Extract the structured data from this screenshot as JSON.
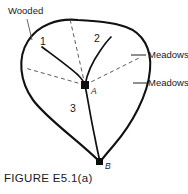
{
  "figure": {
    "caption": "FIGURE E5.1(a)",
    "regions": [
      {
        "id": "region-1",
        "label": "1",
        "x": 40,
        "y": 45
      },
      {
        "id": "region-2",
        "label": "2",
        "x": 94,
        "y": 42
      },
      {
        "id": "region-3",
        "label": "3",
        "x": 70,
        "y": 112
      }
    ],
    "nodes": [
      {
        "id": "node-a",
        "label": "A",
        "x": 85,
        "y": 85,
        "label_x": 91,
        "label_y": 94
      },
      {
        "id": "node-b",
        "label": "B",
        "x": 100,
        "y": 162,
        "label_x": 105,
        "label_y": 169
      }
    ],
    "annotations": [
      {
        "id": "annotation-wooded",
        "label": "Wooded",
        "x": 8,
        "y": 14
      },
      {
        "id": "annotation-meadows-upper",
        "label": "Meadows",
        "x": 140,
        "y": 58
      },
      {
        "id": "annotation-meadows-lower",
        "label": "Meadows",
        "x": 140,
        "y": 86
      }
    ],
    "colors": {
      "boundary": "#111111",
      "divider": "#111111",
      "dashed": "#4a4a4a",
      "leader": "#555555",
      "node": "#0d0d0d",
      "text": "#1a1a1a",
      "background": "#ffffff"
    }
  }
}
